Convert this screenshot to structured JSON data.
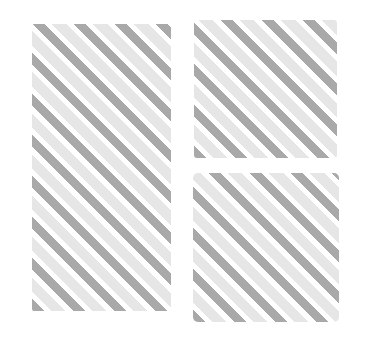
{
  "image": {
    "description": "Three rectangular panels filled with diagonal alternating gray stripes on a white background",
    "background": "#ffffff",
    "stripe_colors": {
      "dark": "#a9a9a9",
      "light": "#e6e6e6",
      "gap": "#ffffff"
    },
    "stripe_angle_deg": 45,
    "panels": [
      {
        "id": "left",
        "label": ""
      },
      {
        "id": "top-right",
        "label": ""
      },
      {
        "id": "bottom-right",
        "label": ""
      }
    ]
  }
}
